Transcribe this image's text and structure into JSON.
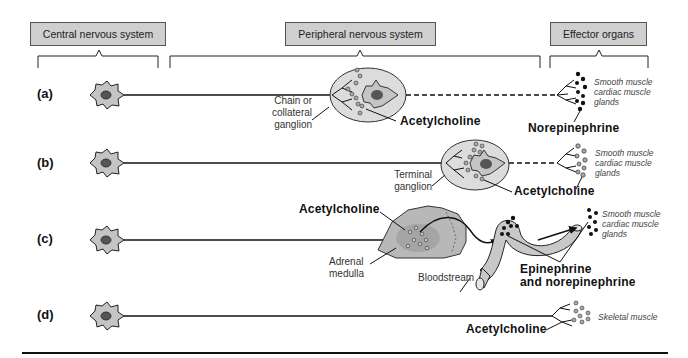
{
  "headers": {
    "cns": "Central nervous system",
    "pns": "Peripheral nervous system",
    "effector": "Effector organs"
  },
  "rows": [
    {
      "label": "(a)",
      "ganglion_label_lines": [
        "Chain or",
        "collateral",
        "ganglion"
      ],
      "preganglionic_transmitter": "Acetylcholine",
      "postganglionic_transmitter": "Norepinephrine",
      "effector_lines": [
        "Smooth muscle",
        "cardiac muscle",
        "glands"
      ]
    },
    {
      "label": "(b)",
      "ganglion_label_lines": [
        "Terminal",
        "ganglion"
      ],
      "transmitter": "Acetylcholine",
      "effector_lines": [
        "Smooth muscle",
        "cardiac muscle",
        "glands"
      ]
    },
    {
      "label": "(c)",
      "transmitter": "Acetylcholine",
      "organ_label_lines": [
        "Adrenal",
        "medulla"
      ],
      "vessel_label": "Bloodstream",
      "hormone_lines": [
        "Epinephrine",
        "and norepinephrine"
      ],
      "effector_lines": [
        "Smooth muscle",
        "cardiac muscle",
        "glands"
      ]
    },
    {
      "label": "(d)",
      "transmitter": "Acetylcholine",
      "effector_lines": [
        "Skeletal muscle"
      ]
    }
  ],
  "colors": {
    "header_fill": "#cfcfcf",
    "ganglion_fill": "#dcdcdc",
    "neuron_fill": "#c4c4c4",
    "line": "#111111",
    "vesicle_dark": "#111111",
    "vesicle_light": "#9a9a9a"
  }
}
